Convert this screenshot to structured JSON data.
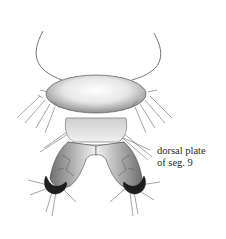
{
  "diagram": {
    "labels": [
      {
        "id": "dorsal-plate-seg-9",
        "lines": [
          "dorsal plate",
          "of seg. 9"
        ]
      }
    ],
    "colors": {
      "ink": "#2a2a2a",
      "plate_light": "#f4f4f4",
      "plate_shade": "#9a9a9a",
      "claw_dark": "#1e1e1e",
      "background": "#ffffff"
    }
  }
}
